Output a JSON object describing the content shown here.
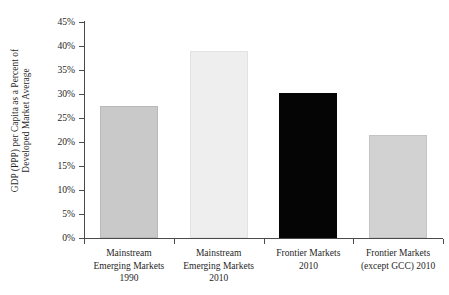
{
  "chart_data": {
    "type": "bar",
    "title": "",
    "xlabel": "",
    "ylabel": "GDP (PPP) per Capita as a Percent of Developed Market Average",
    "ylabel_lines": [
      "GDP (PPP) per Capita as a Percent of",
      "Developed Market Average"
    ],
    "categories": [
      "Mainstream Emerging Markets 1990",
      "Mainstream Emerging Markets 2010",
      "Frontier Markets 2010",
      "Frontier Markets (except GCC) 2010"
    ],
    "category_lines": [
      [
        "Mainstream",
        "Emerging Markets",
        "1990"
      ],
      [
        "Mainstream",
        "Emerging Markets",
        "2010"
      ],
      [
        "Frontier Markets",
        "2010",
        ""
      ],
      [
        "Frontier Markets",
        "(except GCC) 2010",
        ""
      ]
    ],
    "values": [
      27.5,
      38.9,
      30.2,
      21.5
    ],
    "value_labels": [
      "27.5%",
      "38.9%",
      "30.2%",
      "21.5%"
    ],
    "bar_colors": [
      "#c9c9c9",
      "#eeeeee",
      "#050505",
      "#d2d2d2"
    ],
    "bar_border_colors": [
      "#b9b9b9",
      "#e2e2e2",
      "#050505",
      "#c4c4c4"
    ],
    "ylim": [
      0,
      45
    ],
    "ytick_values": [
      0,
      5,
      10,
      15,
      20,
      25,
      30,
      35,
      40,
      45
    ],
    "ytick_labels": [
      "0%",
      "5%",
      "10%",
      "15%",
      "20%",
      "25%",
      "30%",
      "35%",
      "40%",
      "45%"
    ],
    "grid": false,
    "legend": "none",
    "highlight_index": 2,
    "axis_color": "#4a4a4a",
    "background_color": "#ffffff"
  }
}
